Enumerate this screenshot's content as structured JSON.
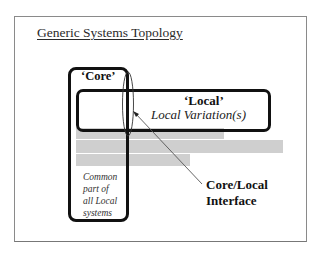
{
  "slide": {
    "title": "Generic Systems Topology"
  },
  "core": {
    "label": "‘Core’",
    "description_lines": [
      "Common",
      "part of",
      "all Local",
      "systems"
    ]
  },
  "local": {
    "label": "‘Local’",
    "sublabel": "Local Variation(s)"
  },
  "interface": {
    "label_lines": [
      "Core/Local",
      "Interface"
    ]
  },
  "colors": {
    "frame": "#8a8a8a",
    "box_stroke": "#111111",
    "gray_bars": "#cfcfcf"
  }
}
